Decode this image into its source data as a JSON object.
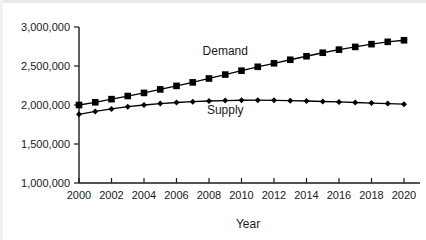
{
  "chart_data": {
    "type": "line",
    "title": "",
    "subtitle": "",
    "xlabel": "Year",
    "ylabel": "",
    "xlim": [
      2000,
      2020
    ],
    "ylim": [
      1000000,
      3000000
    ],
    "grid": false,
    "legend_position": "inline-annotation",
    "x": [
      2000,
      2001,
      2002,
      2003,
      2004,
      2005,
      2006,
      2007,
      2008,
      2009,
      2010,
      2011,
      2012,
      2013,
      2014,
      2015,
      2016,
      2017,
      2018,
      2019,
      2020
    ],
    "x_tick_labels": [
      "2000",
      "2002",
      "2004",
      "2006",
      "2008",
      "2010",
      "2012",
      "2014",
      "2016",
      "2018",
      "2020"
    ],
    "x_tick_values": [
      2000,
      2002,
      2004,
      2006,
      2008,
      2010,
      2012,
      2014,
      2016,
      2018,
      2020
    ],
    "y_tick_labels": [
      "1,000,000",
      "1,500,000",
      "2,000,000",
      "2,500,000",
      "3,000,000"
    ],
    "y_tick_values": [
      1000000,
      1500000,
      2000000,
      2500000,
      3000000
    ],
    "series": [
      {
        "name": "Demand",
        "marker": "square",
        "color": "#000000",
        "label_x": 2009,
        "label_y": 2640000,
        "values": [
          2000000,
          2035000,
          2075000,
          2115000,
          2155000,
          2200000,
          2245000,
          2290000,
          2340000,
          2390000,
          2440000,
          2490000,
          2535000,
          2580000,
          2625000,
          2670000,
          2710000,
          2745000,
          2780000,
          2810000,
          2830000
        ]
      },
      {
        "name": "Supply",
        "marker": "diamond",
        "color": "#000000",
        "label_x": 2009,
        "label_y": 1880000,
        "values": [
          1880000,
          1918000,
          1950000,
          1978000,
          2000000,
          2018000,
          2032000,
          2043000,
          2051000,
          2057000,
          2061000,
          2062000,
          2060000,
          2056000,
          2051000,
          2045000,
          2039000,
          2032000,
          2025000,
          2018000,
          2010000
        ]
      }
    ]
  },
  "axis": {
    "x_title": "Year"
  }
}
